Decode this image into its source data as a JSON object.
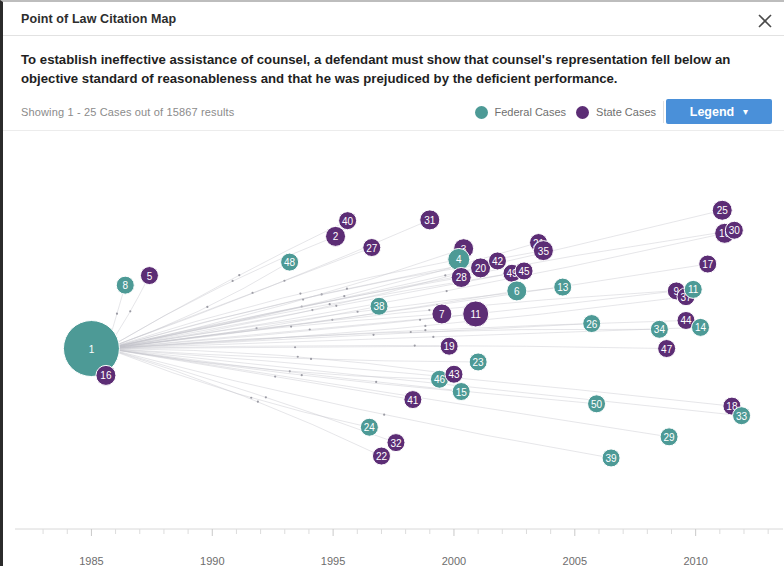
{
  "window": {
    "title": "Point of Law Citation Map",
    "close_icon": "close-icon"
  },
  "statement": "To establish ineffective assistance of counsel, a defendant must show that counsel's representation fell below an objective standard of reasonableness and that he was prejudiced by the deficient performance.",
  "meta": {
    "showing": "Showing 1 - 25 Cases out of 15867 results"
  },
  "legend": {
    "items": [
      {
        "label": "Federal Cases",
        "color": "#4d9a96"
      },
      {
        "label": "State Cases",
        "color": "#5c2d75"
      }
    ],
    "button_label": "Legend",
    "button_chevron": "chevron-down-icon",
    "button_color": "#4a90d9"
  },
  "chart_data": {
    "type": "scatter",
    "title": "Point of Law Citation Map",
    "xlabel": "",
    "ylabel": "",
    "xlim": [
      1982.5,
      2013.2
    ],
    "ylim": [
      0,
      100
    ],
    "grid": false,
    "legend_position": "top-right",
    "x_ticks": [
      1985,
      1990,
      1995,
      2000,
      2005,
      2010
    ],
    "x_minor_ticks": [
      1983,
      1984,
      1986,
      1987,
      1988,
      1989,
      1991,
      1992,
      1993,
      1994,
      1996,
      1997,
      1998,
      1999,
      2001,
      2002,
      2003,
      2004,
      2006,
      2007,
      2008,
      2009,
      2011,
      2012,
      2013
    ],
    "series": [
      {
        "name": "Federal Cases",
        "color": "#4d9a96"
      },
      {
        "name": "State Cases",
        "color": "#5c2d75"
      }
    ],
    "points": [
      {
        "label": "1",
        "x": 1985.0,
        "y": 47.0,
        "r": 28,
        "court": "Federal Cases"
      },
      {
        "label": "16",
        "x": 1985.6,
        "y": 40.0,
        "r": 10,
        "court": "State Cases"
      },
      {
        "label": "8",
        "x": 1986.4,
        "y": 63.5,
        "r": 9,
        "court": "Federal Cases"
      },
      {
        "label": "5",
        "x": 1987.4,
        "y": 66.0,
        "r": 9,
        "court": "State Cases"
      },
      {
        "label": "48",
        "x": 1993.2,
        "y": 69.5,
        "r": 9,
        "court": "Federal Cases"
      },
      {
        "label": "2",
        "x": 1995.1,
        "y": 76.2,
        "r": 10,
        "court": "State Cases"
      },
      {
        "label": "40",
        "x": 1995.6,
        "y": 80.3,
        "r": 9,
        "court": "State Cases"
      },
      {
        "label": "27",
        "x": 1996.6,
        "y": 73.3,
        "r": 9,
        "court": "State Cases"
      },
      {
        "label": "38",
        "x": 1996.9,
        "y": 58.0,
        "r": 9,
        "court": "Federal Cases"
      },
      {
        "label": "24",
        "x": 1996.5,
        "y": 26.5,
        "r": 9,
        "court": "Federal Cases"
      },
      {
        "label": "22",
        "x": 1997.0,
        "y": 19.0,
        "r": 9,
        "court": "State Cases"
      },
      {
        "label": "32",
        "x": 1997.6,
        "y": 22.5,
        "r": 9,
        "court": "State Cases"
      },
      {
        "label": "41",
        "x": 1998.3,
        "y": 33.7,
        "r": 9,
        "court": "State Cases"
      },
      {
        "label": "31",
        "x": 1999.0,
        "y": 80.5,
        "r": 10,
        "court": "State Cases"
      },
      {
        "label": "46",
        "x": 1999.4,
        "y": 39.0,
        "r": 9,
        "court": "Federal Cases"
      },
      {
        "label": "43",
        "x": 2000.0,
        "y": 40.3,
        "r": 9,
        "court": "State Cases"
      },
      {
        "label": "7",
        "x": 1999.5,
        "y": 56.0,
        "r": 10,
        "court": "State Cases"
      },
      {
        "label": "19",
        "x": 1999.8,
        "y": 47.6,
        "r": 9,
        "court": "State Cases"
      },
      {
        "label": "15",
        "x": 2000.3,
        "y": 35.8,
        "r": 9,
        "court": "Federal Cases"
      },
      {
        "label": "3",
        "x": 2000.4,
        "y": 73.0,
        "r": 10,
        "court": "State Cases"
      },
      {
        "label": "4",
        "x": 2000.2,
        "y": 70.2,
        "r": 11,
        "court": "Federal Cases"
      },
      {
        "label": "28",
        "x": 2000.3,
        "y": 65.5,
        "r": 10,
        "court": "State Cases"
      },
      {
        "label": "11",
        "x": 2000.9,
        "y": 56.0,
        "r": 13,
        "court": "State Cases"
      },
      {
        "label": "23",
        "x": 2001.0,
        "y": 43.5,
        "r": 9,
        "court": "Federal Cases"
      },
      {
        "label": "20",
        "x": 2001.1,
        "y": 68.0,
        "r": 10,
        "court": "State Cases"
      },
      {
        "label": "42",
        "x": 2001.8,
        "y": 69.8,
        "r": 9,
        "court": "State Cases"
      },
      {
        "label": "49",
        "x": 2002.4,
        "y": 66.6,
        "r": 9,
        "court": "State Cases"
      },
      {
        "label": "45",
        "x": 2002.9,
        "y": 67.2,
        "r": 9,
        "court": "State Cases"
      },
      {
        "label": "6",
        "x": 2002.6,
        "y": 62.0,
        "r": 10,
        "court": "Federal Cases"
      },
      {
        "label": "21",
        "x": 2003.5,
        "y": 74.6,
        "r": 9,
        "court": "State Cases"
      },
      {
        "label": "35",
        "x": 2003.7,
        "y": 72.5,
        "r": 10,
        "court": "State Cases"
      },
      {
        "label": "13",
        "x": 2004.5,
        "y": 63.0,
        "r": 9,
        "court": "Federal Cases"
      },
      {
        "label": "26",
        "x": 2005.7,
        "y": 53.5,
        "r": 9,
        "court": "Federal Cases"
      },
      {
        "label": "50",
        "x": 2005.9,
        "y": 32.6,
        "r": 9,
        "court": "Federal Cases"
      },
      {
        "label": "39",
        "x": 2006.5,
        "y": 18.5,
        "r": 9,
        "court": "Federal Cases"
      },
      {
        "label": "34",
        "x": 2008.5,
        "y": 52.0,
        "r": 9,
        "court": "Federal Cases"
      },
      {
        "label": "47",
        "x": 2008.8,
        "y": 47.0,
        "r": 9,
        "court": "State Cases"
      },
      {
        "label": "29",
        "x": 2008.9,
        "y": 24.0,
        "r": 9,
        "court": "Federal Cases"
      },
      {
        "label": "9",
        "x": 2009.2,
        "y": 62.0,
        "r": 9,
        "court": "State Cases"
      },
      {
        "label": "37",
        "x": 2009.6,
        "y": 60.5,
        "r": 9,
        "court": "State Cases"
      },
      {
        "label": "11b",
        "x": 2009.9,
        "y": 62.4,
        "r": 9,
        "court": "Federal Cases",
        "display": "11"
      },
      {
        "label": "44",
        "x": 2009.6,
        "y": 54.3,
        "r": 9,
        "court": "State Cases"
      },
      {
        "label": "14",
        "x": 2010.2,
        "y": 52.5,
        "r": 9,
        "court": "Federal Cases"
      },
      {
        "label": "17",
        "x": 2010.5,
        "y": 69.0,
        "r": 9,
        "court": "State Cases"
      },
      {
        "label": "10",
        "x": 2011.2,
        "y": 77.0,
        "r": 10,
        "court": "State Cases"
      },
      {
        "label": "30",
        "x": 2011.6,
        "y": 77.8,
        "r": 9,
        "court": "State Cases",
        "display": "30"
      },
      {
        "label": "18",
        "x": 2011.5,
        "y": 32.0,
        "r": 9,
        "court": "State Cases"
      },
      {
        "label": "33",
        "x": 2011.9,
        "y": 29.5,
        "r": 9,
        "court": "Federal Cases"
      },
      {
        "label": "25",
        "x": 2011.1,
        "y": 83.0,
        "r": 10,
        "court": "State Cases"
      }
    ],
    "edges_from": "1",
    "edges_note": "Faint curved citation links radiate from node 1 to most other nodes"
  }
}
